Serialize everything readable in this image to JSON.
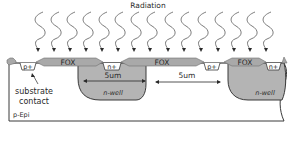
{
  "title": "Radiation",
  "colors": {
    "fox": "#a9a9a9",
    "fox_stroke": "#6f6f6f",
    "nwell": "#b4b4b4",
    "nwell_stroke": "#3a3a3a",
    "substrate": "#ffffff",
    "outline": "#3a3a3a",
    "arrow": "#5a5a5a",
    "text": "#2a2a2a"
  },
  "labels": {
    "fox_1": "FOX",
    "fox_2": "FOX",
    "fox_3": "FOX",
    "p_plus_1": "p+",
    "n_plus_1": "n+",
    "p_plus_2": "p+",
    "n_plus_2": "n+",
    "nwell_1": "n-well",
    "nwell_2": "n-well",
    "dim_1": "5um",
    "dim_2": "5um",
    "substrate_contact_line1": "substrate",
    "substrate_contact_line2": "contact",
    "substrate": "p-Epi"
  },
  "radiation": {
    "count": 15,
    "x_positions": [
      38,
      54,
      70,
      86,
      102,
      118,
      134,
      150,
      168,
      184,
      201,
      218,
      234,
      250,
      266
    ]
  }
}
